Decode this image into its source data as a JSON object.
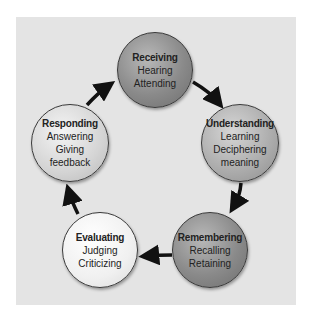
{
  "diagram": {
    "type": "cycle",
    "nodes": [
      {
        "id": "receiving",
        "title": "Receiving",
        "lines": [
          "Hearing",
          "Attending"
        ],
        "shade": "dark"
      },
      {
        "id": "understanding",
        "title": "Understanding",
        "lines": [
          "Learning",
          "Deciphering",
          "meaning"
        ],
        "shade": "medium"
      },
      {
        "id": "remembering",
        "title": "Remembering",
        "lines": [
          "Recalling",
          "Retaining"
        ],
        "shade": "dark"
      },
      {
        "id": "evaluating",
        "title": "Evaluating",
        "lines": [
          "Judging",
          "Criticizing"
        ],
        "shade": "white"
      },
      {
        "id": "responding",
        "title": "Responding",
        "lines": [
          "Answering",
          "Giving",
          "feedback"
        ],
        "shade": "light"
      }
    ],
    "edges": [
      {
        "from": "receiving",
        "to": "understanding"
      },
      {
        "from": "understanding",
        "to": "remembering"
      },
      {
        "from": "remembering",
        "to": "evaluating"
      },
      {
        "from": "evaluating",
        "to": "responding"
      },
      {
        "from": "responding",
        "to": "receiving"
      }
    ],
    "colors": {
      "panel": "#e4e4e4",
      "arrow": "#111111",
      "border": "#3a3a3a"
    }
  }
}
